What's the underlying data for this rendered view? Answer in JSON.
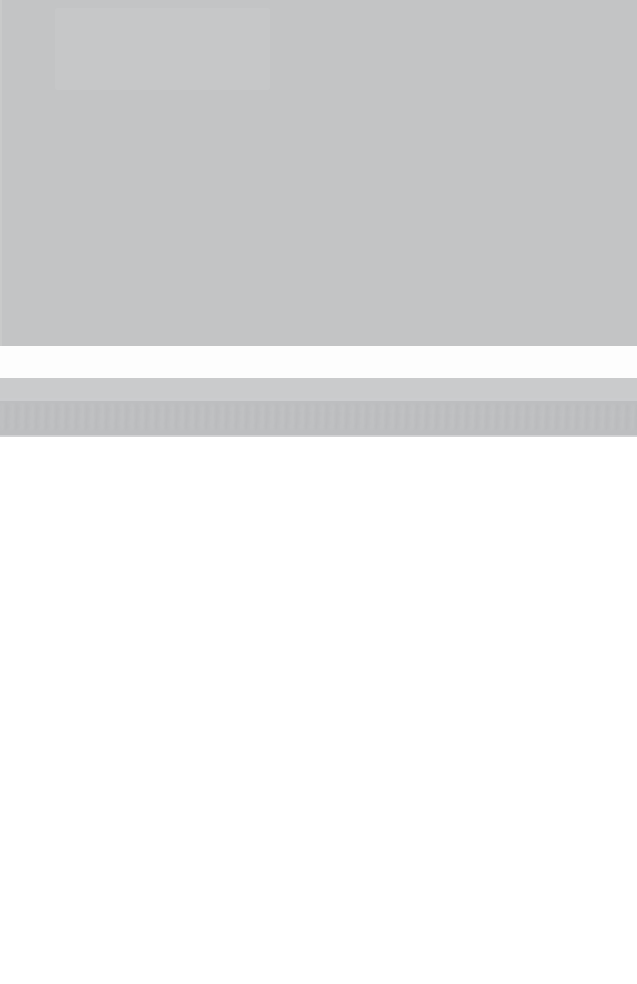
{
  "meta": {
    "width": 637,
    "height": 984,
    "legibility": "none"
  },
  "colors": {
    "chrome_gray": "#c3c4c5",
    "white_strip": "#fdfdfd",
    "light_strip": "#cacbcc",
    "blurred_bar": "#bdbec0",
    "page_white": "#ffffff"
  },
  "regions": {
    "chrome_block": {
      "label": "",
      "y": 0,
      "height": 346,
      "color": "#c3c4c5"
    },
    "chrome_patch": {
      "label": "",
      "x": 55,
      "y": 8,
      "width": 215,
      "height": 82
    },
    "white_strip": {
      "label": "",
      "y": 346,
      "height": 32,
      "color": "#fdfdfd"
    },
    "light_strip": {
      "label": "",
      "y": 378,
      "height": 20,
      "color": "#cacbcc"
    },
    "blurred_bar": {
      "label": "",
      "y": 398,
      "height": 39,
      "color": "#bdbec0",
      "note": "Contains vertical ringing artifacts consistent with a row of text labels, but no characters are recoverable."
    },
    "page_body": {
      "label": "",
      "y": 437,
      "height": 547,
      "color": "#ffffff"
    }
  }
}
